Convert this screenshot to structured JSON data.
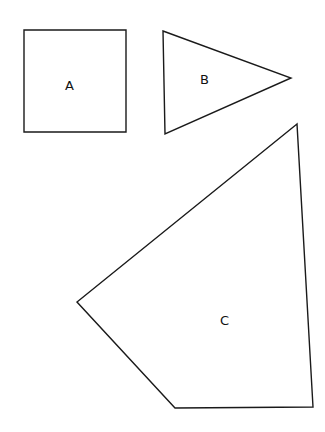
{
  "diagram": {
    "shapes": [
      {
        "id": "A",
        "type": "square",
        "label": "A",
        "points": "24,30 126,30 126,132 24,132",
        "label_pos": [
          69,
          86
        ]
      },
      {
        "id": "B",
        "type": "triangle",
        "label": "B",
        "points": "163,31 291,78 165,134",
        "label_pos": [
          205,
          84
        ]
      },
      {
        "id": "C",
        "type": "quadrilateral",
        "label": "C",
        "points": "297,124 77,302 175,408 313,407",
        "label_pos": [
          225,
          325
        ]
      }
    ],
    "stroke_color": "#1a1a1a",
    "background": "#ffffff"
  }
}
